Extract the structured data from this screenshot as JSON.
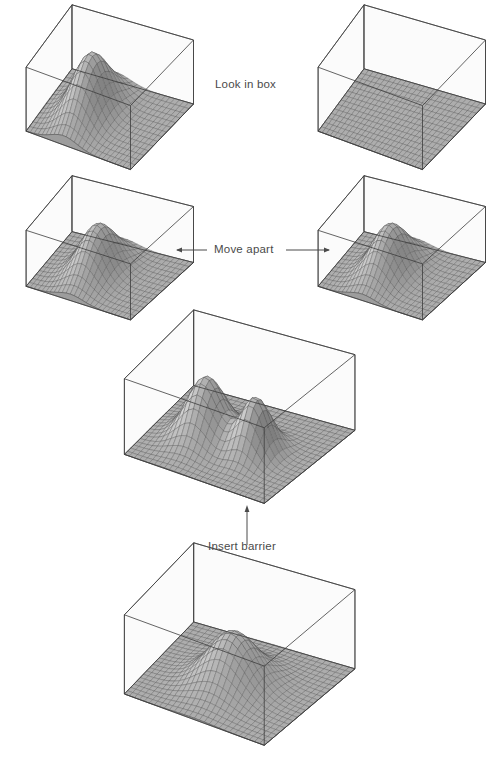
{
  "figure": {
    "title": "",
    "background": "#ffffff",
    "line_color": "#3c3c3c",
    "mesh_color": "#4b4b4b",
    "surface_fill": "#b9b9b9",
    "box_fill": "#f7f7f7",
    "caption_color": "#4a4a4a"
  },
  "annotations": [
    {
      "id": "look-in-box",
      "label": "Look in box",
      "x": 215,
      "y": 78,
      "arrow": "none"
    },
    {
      "id": "move-apart",
      "label": "Move apart",
      "x": 214,
      "y": 243,
      "arrow": "double-horizontal"
    },
    {
      "id": "insert-barrier",
      "label": "Insert barrier",
      "x": 208,
      "y": 540,
      "arrow": "up"
    }
  ],
  "arrows": {
    "move_apart": {
      "left_tail_x": 320,
      "left_head_x": 176,
      "right_tail_x": 286,
      "right_head_x": 330,
      "y": 250
    },
    "insert_barrier": {
      "x": 247,
      "tail_y": 545,
      "head_y": 506
    }
  },
  "panels": [
    {
      "id": "panel-top-left",
      "name": "box-with-wavefunction-top-left",
      "x": 18,
      "y": 12,
      "w": 180,
      "h": 160,
      "aspect": "wide",
      "peaks": [
        {
          "cx": 0.36,
          "cy": 0.5,
          "amp": 1.0,
          "sx": 0.125,
          "sy": 0.26
        }
      ]
    },
    {
      "id": "panel-top-right",
      "name": "empty-box-top-right",
      "x": 310,
      "y": 12,
      "w": 180,
      "h": 160,
      "aspect": "wide",
      "peaks": []
    },
    {
      "id": "panel-mid-left",
      "name": "box-with-wavefunction-mid-left",
      "x": 18,
      "y": 182,
      "w": 180,
      "h": 140,
      "aspect": "wide",
      "peaks": [
        {
          "cx": 0.42,
          "cy": 0.5,
          "amp": 0.92,
          "sx": 0.125,
          "sy": 0.25
        }
      ]
    },
    {
      "id": "panel-mid-right",
      "name": "box-with-wavefunction-mid-right",
      "x": 310,
      "y": 182,
      "w": 180,
      "h": 140,
      "aspect": "wide",
      "peaks": [
        {
          "cx": 0.42,
          "cy": 0.5,
          "amp": 0.92,
          "sx": 0.125,
          "sy": 0.25
        }
      ]
    },
    {
      "id": "panel-center",
      "name": "wide-box-with-two-wavefunctions",
      "x": 108,
      "y": 334,
      "w": 252,
      "h": 172,
      "aspect": "square",
      "peaks": [
        {
          "cx": 0.33,
          "cy": 0.46,
          "amp": 0.88,
          "sx": 0.11,
          "sy": 0.15
        },
        {
          "cx": 0.66,
          "cy": 0.46,
          "amp": 0.8,
          "sx": 0.085,
          "sy": 0.12
        }
      ]
    },
    {
      "id": "panel-bottom",
      "name": "wide-box-with-merged-wavefunction",
      "x": 108,
      "y": 568,
      "w": 252,
      "h": 180,
      "aspect": "square",
      "peaks": [
        {
          "cx": 0.5,
          "cy": 0.47,
          "amp": 0.72,
          "sx": 0.145,
          "sy": 0.175
        }
      ]
    }
  ],
  "chart_data": {
    "type": "surface-sequence",
    "xlabel": "",
    "ylabel": "",
    "grid": true,
    "legend": "none",
    "surfaces": [
      {
        "panel": "panel-top-left",
        "peak_count": 1,
        "peak_positions": [
          [
            0.36,
            0.5
          ]
        ],
        "peak_heights": [
          1.0
        ]
      },
      {
        "panel": "panel-top-right",
        "peak_count": 0,
        "peak_positions": [],
        "peak_heights": []
      },
      {
        "panel": "panel-mid-left",
        "peak_count": 1,
        "peak_positions": [
          [
            0.42,
            0.5
          ]
        ],
        "peak_heights": [
          0.92
        ]
      },
      {
        "panel": "panel-mid-right",
        "peak_count": 1,
        "peak_positions": [
          [
            0.42,
            0.5
          ]
        ],
        "peak_heights": [
          0.92
        ]
      },
      {
        "panel": "panel-center",
        "peak_count": 2,
        "peak_positions": [
          [
            0.33,
            0.46
          ],
          [
            0.66,
            0.46
          ]
        ],
        "peak_heights": [
          0.88,
          0.8
        ]
      },
      {
        "panel": "panel-bottom",
        "peak_count": 1,
        "peak_positions": [
          [
            0.5,
            0.47
          ]
        ],
        "peak_heights": [
          0.72
        ]
      }
    ]
  }
}
